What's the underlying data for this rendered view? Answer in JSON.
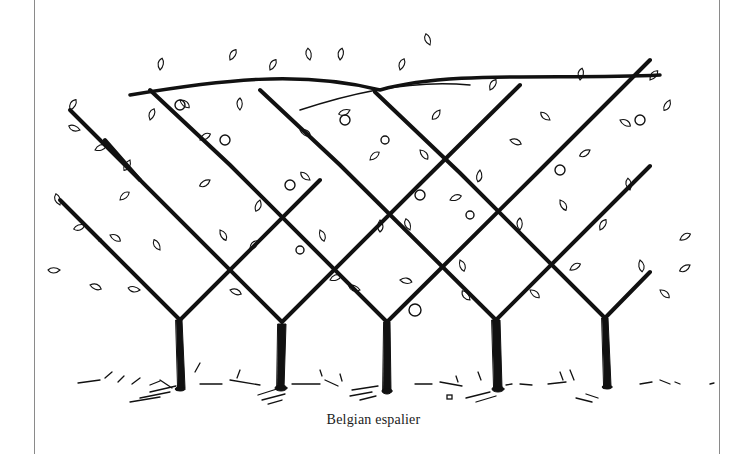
{
  "figure": {
    "caption": "Belgian espalier",
    "tree_count": 5,
    "colors": {
      "ink": "#111111",
      "page": "#ffffff",
      "rule": "#8a8a8a"
    }
  }
}
